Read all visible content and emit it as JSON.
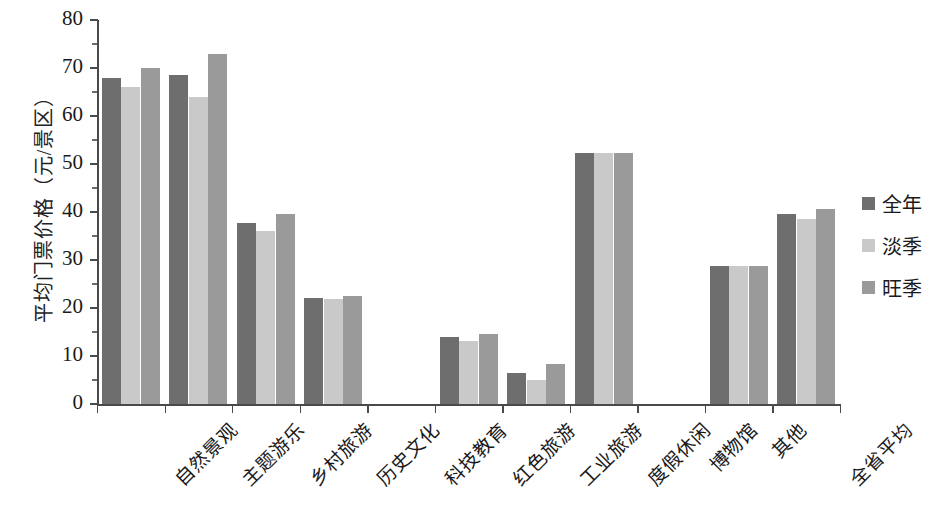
{
  "chart_data": {
    "type": "bar",
    "title": "",
    "xlabel": "",
    "ylabel": "平均门票价格（元/景区）",
    "ylim": [
      0,
      80
    ],
    "ytick_step": 10,
    "grid": false,
    "legend_position": "right",
    "categories": [
      "自然景观",
      "主题游乐",
      "乡村旅游",
      "历史文化",
      "科技教育",
      "红色旅游",
      "工业旅游",
      "度假休闲",
      "博物馆",
      "其他",
      "全省平均"
    ],
    "ytick_labels": [
      "0",
      "10",
      "20",
      "30",
      "40",
      "50",
      "60",
      "70",
      "80"
    ],
    "series": [
      {
        "name": "全年",
        "color": "#6e6e6e",
        "values": [
          68.0,
          68.5,
          37.7,
          22.0,
          0,
          14.0,
          6.5,
          52.2,
          0,
          28.8,
          39.5
        ]
      },
      {
        "name": "淡季",
        "color": "#c9c9c9",
        "values": [
          66.0,
          64.0,
          36.0,
          21.8,
          0,
          13.2,
          5.0,
          52.2,
          0,
          28.8,
          38.6
        ]
      },
      {
        "name": "旺季",
        "color": "#9a9a9a",
        "values": [
          70.0,
          73.0,
          39.6,
          22.4,
          0,
          14.5,
          8.3,
          52.2,
          0,
          28.8,
          40.6
        ]
      }
    ]
  },
  "legend": {
    "items": [
      {
        "label": "全年",
        "color": "#6e6e6e"
      },
      {
        "label": "淡季",
        "color": "#c9c9c9"
      },
      {
        "label": "旺季",
        "color": "#9a9a9a"
      }
    ]
  }
}
